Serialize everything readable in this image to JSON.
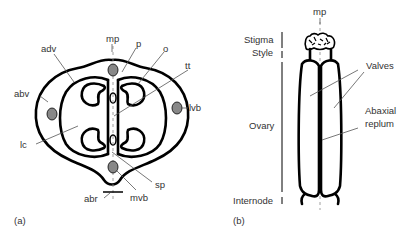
{
  "panel_a": {
    "caption": "(a)",
    "labels": {
      "mp": "mp",
      "p": "p",
      "o": "o",
      "adv": "adv",
      "tt": "tt",
      "abv": "abv",
      "lvb": "lvb",
      "lc": "lc",
      "sp": "sp",
      "mvb": "mvb",
      "abr": "abr"
    }
  },
  "panel_b": {
    "caption": "(b)",
    "labels": {
      "mp": "mp",
      "stigma": "Stigma",
      "style": "Style",
      "ovary": "Ovary",
      "internode": "Internode",
      "valves": "Valves",
      "abaxial": "Abaxial",
      "replum": "replum"
    }
  },
  "colors": {
    "outline": "#000000",
    "vascular_bundle": "#888888",
    "leader": "#555555",
    "text": "#333333"
  }
}
